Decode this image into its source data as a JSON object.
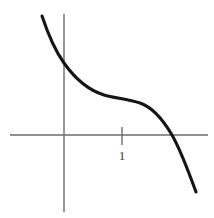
{
  "figure": {
    "width": 214,
    "height": 218,
    "background_color": "#ffffff",
    "axis_color": "#6b6b6b",
    "curve_color": "#151515",
    "label_color": "#3d3d3d"
  },
  "axes": {
    "x_axis": {
      "name": "x-axis",
      "y_pixel": 135,
      "x_start_pixel": 10,
      "x_end_pixel": 208
    },
    "y_axis": {
      "name": "y-axis",
      "x_pixel": 64,
      "y_start_pixel": 14,
      "y_end_pixel": 212
    }
  },
  "ticks": [
    {
      "label": "1",
      "axis": "x",
      "value": 1,
      "x_pixel": 122,
      "tick_top_pixel": 127,
      "tick_bottom_pixel": 145,
      "label_x_pixel": 122,
      "label_y_pixel": 149
    }
  ],
  "chart_data": {
    "type": "line",
    "title": "",
    "subtitle": "",
    "xlabel": "",
    "ylabel": "",
    "grid": false,
    "legend": null,
    "annotations": [],
    "xlim": [
      -0.93,
      2.47
    ],
    "ylim": [
      -0.98,
      2.07
    ],
    "x_tick_labels": [
      "1"
    ],
    "x_tick_values": [
      1
    ],
    "y_tick_labels": [],
    "y_tick_values": [],
    "series": [
      {
        "name": "curve",
        "x": [
          -0.38,
          -0.28,
          -0.17,
          -0.07,
          0.0,
          0.1,
          0.21,
          0.34,
          0.52,
          0.72,
          0.93,
          1.09,
          1.24,
          1.4,
          1.57,
          1.72,
          1.86,
          2.0,
          2.14,
          2.26
        ],
        "y": [
          1.86,
          1.53,
          1.26,
          1.03,
          0.89,
          0.74,
          0.62,
          0.52,
          0.44,
          0.4,
          0.38,
          0.37,
          0.35,
          0.31,
          0.22,
          0.08,
          -0.1,
          -0.32,
          -0.58,
          -0.8
        ],
        "x_pixels": [
          42,
          48,
          55,
          61,
          65,
          71,
          78,
          86,
          97,
          109,
          122,
          132,
          141,
          151,
          161,
          170,
          179,
          187,
          196,
          203
        ],
        "y_pixels": [
          16,
          34,
          49,
          62,
          70,
          78,
          85,
          91,
          95,
          97,
          98,
          99,
          100,
          102,
          107,
          115,
          125,
          137,
          152,
          164
        ]
      }
    ],
    "curve_path": "M 42,16 C 48,34 56,52 64,63 C 76,80 88,90 104,95 C 114,98 128,99 140,103 C 152,107 162,118 172,135 C 180,149 188,170 196,192"
  }
}
